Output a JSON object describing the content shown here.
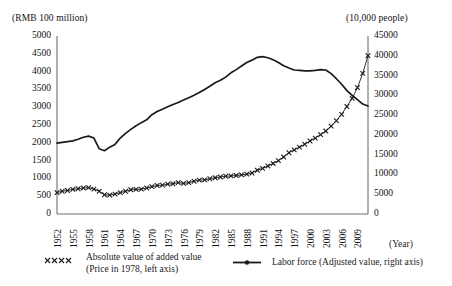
{
  "axes": {
    "left_unit_label": "(RMB 100 million)",
    "right_unit_label": "(10,000 people)",
    "x_axis_name": "(Year)",
    "left_ticks": [
      "5000",
      "4500",
      "4000",
      "3500",
      "3000",
      "2500",
      "2000",
      "1500",
      "1000",
      "500",
      "0"
    ],
    "right_ticks": [
      "45000",
      "40000",
      "35000",
      "30000",
      "25000",
      "20000",
      "15000",
      "10000",
      "5000",
      "0"
    ],
    "x_ticks": [
      "1952",
      "1955",
      "1958",
      "1961",
      "1964",
      "1967",
      "1970",
      "1973",
      "1976",
      "1979",
      "1982",
      "1985",
      "1988",
      "1991",
      "1994",
      "1997",
      "2000",
      "2003",
      "2006",
      "2009"
    ]
  },
  "legend": {
    "series_1_line_1": "Absolute value of added value",
    "series_1_line_2": "(Price in 1978, left axis)",
    "series_1_marker": "xxxx",
    "series_2_label": "Labor force (Adjusted value, right axis)",
    "series_2_marker": "line-with-dot"
  },
  "colors": {
    "line": "#1a1a1a",
    "axis": "#6f6f6f",
    "background": "#ffffff"
  },
  "chart_data": {
    "type": "line",
    "title": "",
    "subtitle": "",
    "xlabel": "(Year)",
    "ylabel": "(RMB 100 million)",
    "y2label": "(10,000 people)",
    "grid": false,
    "legend_position": "below",
    "xlim": [
      1952,
      2011
    ],
    "ylim": [
      0,
      5000
    ],
    "y2lim": [
      0,
      45000
    ],
    "x": [
      1952,
      1953,
      1954,
      1955,
      1956,
      1957,
      1958,
      1959,
      1960,
      1961,
      1962,
      1963,
      1964,
      1965,
      1966,
      1967,
      1968,
      1969,
      1970,
      1971,
      1972,
      1973,
      1974,
      1975,
      1976,
      1977,
      1978,
      1979,
      1980,
      1981,
      1982,
      1983,
      1984,
      1985,
      1986,
      1987,
      1988,
      1989,
      1990,
      1991,
      1992,
      1993,
      1994,
      1995,
      1996,
      1997,
      1998,
      1999,
      2000,
      2001,
      2002,
      2003,
      2004,
      2005,
      2006,
      2007,
      2008,
      2009,
      2010,
      2011
    ],
    "series": [
      {
        "name": "Absolute value of added value (Price in 1978, left axis)",
        "axis": "left",
        "marker": "x",
        "units": "RMB 100 million",
        "values": [
          600,
          640,
          660,
          690,
          710,
          730,
          740,
          700,
          640,
          540,
          530,
          560,
          600,
          640,
          680,
          690,
          700,
          730,
          770,
          800,
          810,
          840,
          850,
          880,
          860,
          880,
          920,
          950,
          960,
          990,
          1020,
          1040,
          1060,
          1070,
          1080,
          1100,
          1120,
          1150,
          1230,
          1280,
          1350,
          1420,
          1500,
          1600,
          1720,
          1800,
          1880,
          1960,
          2050,
          2130,
          2230,
          2330,
          2470,
          2620,
          2800,
          3020,
          3250,
          3550,
          3950,
          4450
        ]
      },
      {
        "name": "Labor force (Adjusted value, right axis)",
        "axis": "right",
        "marker": "line",
        "units": "10,000 people",
        "values": [
          17900,
          18100,
          18300,
          18500,
          18900,
          19400,
          19700,
          19200,
          16500,
          16000,
          16900,
          17600,
          19200,
          20400,
          21400,
          22300,
          23100,
          23800,
          25100,
          25900,
          26500,
          27100,
          27700,
          28200,
          28800,
          29400,
          30000,
          30700,
          31500,
          32300,
          33200,
          33800,
          34600,
          35700,
          36500,
          37400,
          38300,
          38900,
          39600,
          39800,
          39500,
          39000,
          38300,
          37500,
          36900,
          36400,
          36300,
          36200,
          36200,
          36300,
          36500,
          36400,
          35500,
          34200,
          32800,
          31200,
          30000,
          28900,
          27800,
          27300
        ]
      }
    ],
    "annotations": [
      "Labor force peaks circa 1990-1991 near 39800 (10,000 people) then declines.",
      "Labor force shows a sharp dip around 1960-1962 to about 16000.",
      "The two series cross around 2005-2006."
    ]
  }
}
